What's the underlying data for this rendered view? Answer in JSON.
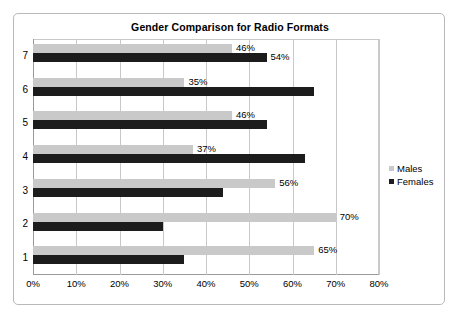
{
  "chart_data": {
    "type": "bar",
    "orientation": "horizontal",
    "title": "Gender Comparison for Radio Formats",
    "xlabel": "",
    "ylabel": "",
    "xlim": [
      0,
      80
    ],
    "xticks": [
      "0%",
      "10%",
      "20%",
      "30%",
      "40%",
      "50%",
      "60%",
      "70%",
      "80%"
    ],
    "xtick_values": [
      0,
      10,
      20,
      30,
      40,
      50,
      60,
      70,
      80
    ],
    "categories": [
      "1",
      "2",
      "3",
      "4",
      "5",
      "6",
      "7"
    ],
    "category_order_top_to_bottom": [
      "7",
      "6",
      "5",
      "4",
      "3",
      "2",
      "1"
    ],
    "grid": "vertical",
    "legend_position": "right",
    "series": [
      {
        "name": "Males",
        "color": "#c9c9c9",
        "values": [
          65,
          70,
          56,
          37,
          46,
          35,
          46
        ],
        "labels": [
          "65%",
          "70%",
          "56%",
          "37%",
          "46%",
          "35%",
          "46%"
        ]
      },
      {
        "name": "Females",
        "color": "#1c1c1c",
        "values": [
          35,
          30,
          44,
          63,
          54,
          65,
          54
        ],
        "labels": [
          "",
          "",
          "",
          "",
          "",
          "",
          "54%"
        ]
      }
    ]
  },
  "legend": {
    "entries": [
      {
        "label": "Males",
        "color": "#c9c9c9"
      },
      {
        "label": "Females",
        "color": "#1c1c1c"
      }
    ]
  }
}
